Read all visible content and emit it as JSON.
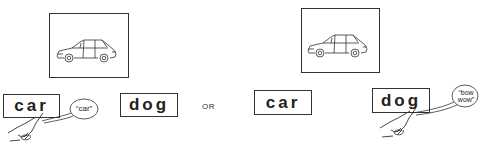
{
  "panels": [
    {
      "picture": {
        "subject": "station-wagon-car"
      },
      "cards": [
        {
          "word": "car",
          "touched": true,
          "speech": [
            "“car”"
          ]
        },
        {
          "word": "dog",
          "touched": false
        }
      ]
    },
    {
      "picture": {
        "subject": "station-wagon-car"
      },
      "cards": [
        {
          "word": "car",
          "touched": false
        },
        {
          "word": "dog",
          "touched": true,
          "speech": [
            "“bow",
            "wow”"
          ]
        }
      ]
    }
  ],
  "separator": "OR",
  "colors": {
    "ink": "#222222",
    "background": "#ffffff"
  }
}
